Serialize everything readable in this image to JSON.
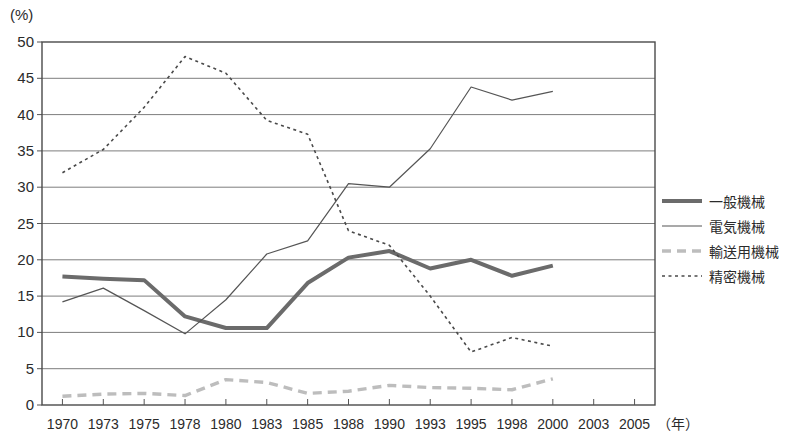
{
  "chart_data": {
    "type": "line",
    "title": "",
    "xlabel": "年",
    "ylabel": "(%)",
    "y_unit_label": "(%)",
    "ylim": [
      0,
      50
    ],
    "ytick_step": 5,
    "yticks": [
      "0",
      "5",
      "10",
      "15",
      "20",
      "25",
      "30",
      "35",
      "40",
      "45",
      "50"
    ],
    "grid": true,
    "grid_axis": "y",
    "legend_position": "right",
    "x": [
      1970,
      1973,
      1975,
      1978,
      1980,
      1983,
      1985,
      1988,
      1990,
      1993,
      1995,
      1998,
      2000,
      2003,
      2005
    ],
    "categories": [
      "1970",
      "1973",
      "1975",
      "1978",
      "1980",
      "1983",
      "1985",
      "1988",
      "1990",
      "1993",
      "1995",
      "1998",
      "2000",
      "2003",
      "2005"
    ],
    "series": [
      {
        "name": "一般機械",
        "style": "thick-solid",
        "color": "#6b6b6b",
        "x": [
          1970,
          1973,
          1975,
          1978,
          1980,
          1983,
          1985,
          1988,
          1990,
          1993,
          1995,
          1998,
          2000
        ],
        "values": [
          17.7,
          17.4,
          17.2,
          12.2,
          10.6,
          10.6,
          16.8,
          20.3,
          21.2,
          18.8,
          20.0,
          17.8,
          19.2
        ]
      },
      {
        "name": "電気機械",
        "style": "thin-solid",
        "color": "#555555",
        "x": [
          1970,
          1973,
          1975,
          1978,
          1980,
          1983,
          1985,
          1988,
          1990,
          1993,
          1995,
          1998,
          2000
        ],
        "values": [
          14.2,
          16.1,
          13.0,
          9.8,
          14.5,
          20.8,
          22.6,
          30.5,
          30.0,
          35.3,
          43.8,
          42.0,
          43.2
        ]
      },
      {
        "name": "輸送用機械",
        "style": "thick-dashed",
        "color": "#bdbdbd",
        "x": [
          1970,
          1973,
          1975,
          1978,
          1980,
          1983,
          1985,
          1988,
          1990,
          1993,
          1995,
          1998,
          2000
        ],
        "values": [
          1.2,
          1.5,
          1.6,
          1.3,
          3.5,
          3.1,
          1.6,
          1.9,
          2.7,
          2.4,
          2.3,
          2.1,
          3.6
        ]
      },
      {
        "name": "精密機械",
        "style": "dotted",
        "color": "#4a4a4a",
        "x": [
          1970,
          1973,
          1975,
          1978,
          1980,
          1983,
          1985,
          1988,
          1990,
          1993,
          1995,
          1998,
          2000
        ],
        "values": [
          32.0,
          35.2,
          41.0,
          48.0,
          45.7,
          39.2,
          37.3,
          24.0,
          22.0,
          15.0,
          7.3,
          9.3,
          8.1
        ]
      }
    ]
  },
  "legend": {
    "items": [
      {
        "label": "一般機械",
        "style": "thick-solid",
        "color": "#6b6b6b"
      },
      {
        "label": "電気機械",
        "style": "thin-solid",
        "color": "#555555"
      },
      {
        "label": "輸送用機械",
        "style": "thick-dashed",
        "color": "#bdbdbd"
      },
      {
        "label": "精密機械",
        "style": "dotted",
        "color": "#4a4a4a"
      }
    ]
  },
  "axes": {
    "x_unit": "（年）",
    "y_unit": "(%)"
  }
}
